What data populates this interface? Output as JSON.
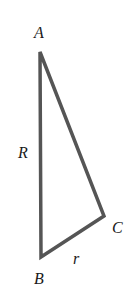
{
  "diagram": {
    "type": "right-triangle",
    "stroke_color": "#555555",
    "vertices": {
      "A": {
        "label": "A",
        "x": 40,
        "y": 52
      },
      "B": {
        "label": "B",
        "x": 41,
        "y": 257
      },
      "C": {
        "label": "C",
        "x": 104,
        "y": 216
      }
    },
    "sides": {
      "AB": {
        "label": "R"
      },
      "BC": {
        "label": "r"
      }
    }
  }
}
